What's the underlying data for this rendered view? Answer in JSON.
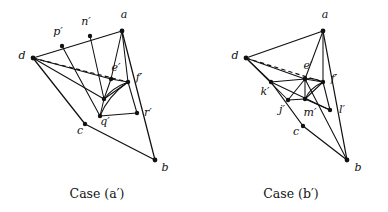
{
  "figure": {
    "type": "geometric-diagram",
    "background_color": "#ffffff",
    "ink_color": "#111111",
    "panels": [
      {
        "id": "case-a-prime",
        "caption": "Case (a′)",
        "vertices": [
          {
            "name": "d",
            "label": "d",
            "x": 33,
            "y": 58,
            "lx": 22,
            "ly": 56
          },
          {
            "name": "p'",
            "label": "p′",
            "x": 62,
            "y": 46,
            "lx": 58,
            "ly": 32
          },
          {
            "name": "n'",
            "label": "n′",
            "x": 90,
            "y": 36,
            "lx": 86,
            "ly": 22
          },
          {
            "name": "a",
            "label": "a",
            "x": 122,
            "y": 31,
            "lx": 124,
            "ly": 15
          },
          {
            "name": "e'",
            "label": "e′",
            "x": 111,
            "y": 79,
            "lx": 116,
            "ly": 68
          },
          {
            "name": "f'",
            "label": "f′",
            "x": 128,
            "y": 82,
            "lx": 139,
            "ly": 78
          },
          {
            "name": "m'",
            "label": "",
            "x": 104,
            "y": 99,
            "lx": 0,
            "ly": 0
          },
          {
            "name": "q'",
            "label": "q′",
            "x": 100,
            "y": 116,
            "lx": 105,
            "ly": 122
          },
          {
            "name": "c",
            "label": "c",
            "x": 85,
            "y": 124,
            "lx": 80,
            "ly": 131
          },
          {
            "name": "r'",
            "label": "r′",
            "x": 137,
            "y": 113,
            "lx": 148,
            "ly": 113
          },
          {
            "name": "b",
            "label": "b",
            "x": 155,
            "y": 160,
            "lx": 165,
            "ly": 168
          }
        ],
        "solid_edges": [
          [
            "d",
            "a"
          ],
          [
            "d",
            "c"
          ],
          [
            "c",
            "b"
          ],
          [
            "a",
            "b"
          ],
          [
            "d",
            "e'"
          ],
          [
            "d",
            "f'"
          ],
          [
            "p'",
            "q'"
          ],
          [
            "n'",
            "m'"
          ],
          [
            "a",
            "e'"
          ],
          [
            "a",
            "f'"
          ],
          [
            "e'",
            "f'"
          ],
          [
            "e'",
            "m'"
          ],
          [
            "m'",
            "f'"
          ],
          [
            "m'",
            "q'"
          ],
          [
            "f'",
            "r'"
          ],
          [
            "q'",
            "r'"
          ]
        ],
        "dashed_edges": [
          [
            "d",
            "f'"
          ]
        ],
        "arcs": [
          {
            "from": "f'",
            "to": "m'",
            "bulge": 4.5
          },
          {
            "from": "f'",
            "to": "q'",
            "bulge": 7.0
          }
        ]
      },
      {
        "id": "case-b-prime",
        "caption": "Case (b′)",
        "vertices": [
          {
            "name": "d",
            "label": "d",
            "x": 246,
            "y": 58,
            "lx": 235,
            "ly": 56
          },
          {
            "name": "a",
            "label": "a",
            "x": 323,
            "y": 31,
            "lx": 325,
            "ly": 15
          },
          {
            "name": "e'",
            "label": "e′",
            "x": 305,
            "y": 79,
            "lx": 308,
            "ly": 66
          },
          {
            "name": "f'",
            "label": "f′",
            "x": 323,
            "y": 82,
            "lx": 334,
            "ly": 79
          },
          {
            "name": "k'",
            "label": "k′",
            "x": 271,
            "y": 82,
            "lx": 265,
            "ly": 92
          },
          {
            "name": "j'",
            "label": "j′",
            "x": 288,
            "y": 100,
            "lx": 282,
            "ly": 110
          },
          {
            "name": "m'",
            "label": "m′",
            "x": 305,
            "y": 99,
            "lx": 310,
            "ly": 113
          },
          {
            "name": "l'",
            "label": "l′",
            "x": 330,
            "y": 110,
            "lx": 342,
            "ly": 110
          },
          {
            "name": "c",
            "label": "c",
            "x": 303,
            "y": 126,
            "lx": 296,
            "ly": 132
          },
          {
            "name": "b",
            "label": "b",
            "x": 347,
            "y": 160,
            "lx": 358,
            "ly": 168
          }
        ],
        "solid_edges": [
          [
            "d",
            "a"
          ],
          [
            "d",
            "k'"
          ],
          [
            "k'",
            "c"
          ],
          [
            "c",
            "b"
          ],
          [
            "a",
            "b"
          ],
          [
            "d",
            "e'"
          ],
          [
            "d",
            "j'"
          ],
          [
            "a",
            "e'"
          ],
          [
            "a",
            "f'"
          ],
          [
            "e'",
            "f'"
          ],
          [
            "e'",
            "m'"
          ],
          [
            "m'",
            "f'"
          ],
          [
            "k'",
            "e'"
          ],
          [
            "k'",
            "l'"
          ],
          [
            "j'",
            "e'"
          ],
          [
            "j'",
            "m'"
          ],
          [
            "m'",
            "l'"
          ],
          [
            "f'",
            "l'"
          ],
          [
            "e'",
            "b"
          ]
        ],
        "dashed_edges": [
          [
            "d",
            "f'"
          ]
        ],
        "arcs": [
          {
            "from": "f'",
            "to": "e'",
            "bulge": 3.2
          },
          {
            "from": "f'",
            "to": "m'",
            "bulge": 4.0
          }
        ]
      }
    ]
  }
}
